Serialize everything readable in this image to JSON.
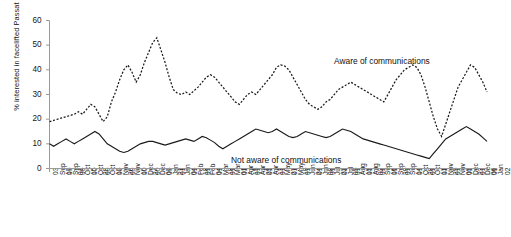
{
  "chart_data": {
    "type": "line",
    "title": "",
    "xlabel": "",
    "ylabel": "% interested in facelifted Passat",
    "ylim": [
      0,
      60
    ],
    "yticks": [
      0,
      10,
      20,
      30,
      40,
      50,
      60
    ],
    "grid": false,
    "legend_position": "inline-annotations",
    "annotations": [
      {
        "text": "Aware of communications",
        "series": "Aware of communications"
      },
      {
        "text": "Not aware of communications",
        "series": "Not aware of communications"
      }
    ],
    "categories": [
      "03 Sep 00",
      "17 Sep 00",
      "01 Oct 00",
      "15 Oct 00",
      "29 Oct 00",
      "12 Nov 00",
      "26 Nov 00",
      "10 Dec 00",
      "24 Dec 00",
      "07 Jan 01",
      "21 Jan 01",
      "04 Feb 01",
      "18 Feb 01",
      "04 Mar 01",
      "18 Mar 01",
      "01 Apr 01",
      "15 Apr 01",
      "29 Apr 01",
      "13 May 01",
      "27 May 01",
      "10 Jun 01",
      "24 Jun 01",
      "08 Jul 01",
      "22 Jul 01",
      "05 Aug 01",
      "19 Aug 01",
      "02 Sep 01",
      "16 Sep 01",
      "30 Sep 01",
      "14 Oct 01",
      "28 Oct 01",
      "11 Nov 01",
      "25 Nov 01",
      "09 Dec 01",
      "23 Dec 01",
      "06 Jan 02"
    ],
    "series": [
      {
        "name": "Aware of communications",
        "style": "dashed",
        "color": "#1a1a1a",
        "values": [
          19,
          19.5,
          20,
          20.5,
          21,
          21.5,
          22,
          23,
          22,
          24,
          26,
          25,
          22,
          19,
          21,
          27,
          31,
          36,
          40,
          42,
          39,
          35,
          38,
          43,
          47,
          51,
          53,
          48,
          43,
          37,
          32,
          30.5,
          30,
          31,
          30,
          31.5
        ],
        "values_extended": [
          33,
          35,
          37,
          38,
          37,
          35,
          33,
          31,
          29,
          27,
          26,
          28,
          30,
          31,
          30,
          32,
          34,
          36,
          38,
          41,
          42,
          41.5,
          40,
          37,
          34,
          31,
          28,
          26,
          25,
          24,
          25,
          27,
          28,
          30,
          32,
          33,
          34,
          35,
          34,
          33,
          32,
          31,
          30,
          29,
          28,
          27,
          30,
          33,
          36,
          38,
          40,
          41,
          42,
          41,
          38,
          33,
          27,
          21,
          16,
          13,
          18,
          23,
          28,
          33,
          36,
          39,
          42,
          41,
          38,
          35,
          31
        ]
      },
      {
        "name": "Not aware of communications",
        "style": "solid",
        "color": "#1a1a1a",
        "values": [
          10,
          9,
          10,
          11,
          12,
          11,
          10,
          11,
          12,
          13,
          14,
          15,
          14,
          12,
          10,
          9,
          8,
          7,
          6.5,
          7,
          8,
          9,
          10,
          10.5,
          11,
          11,
          10.5,
          10,
          9.5,
          10,
          10.5,
          11,
          11.5,
          12,
          11.5,
          11
        ],
        "values_extended": [
          12,
          13,
          12.5,
          11.5,
          10.5,
          9,
          8,
          9,
          10,
          11,
          12,
          13,
          14,
          15,
          16,
          15.5,
          15,
          14.5,
          15,
          16,
          15,
          14,
          13,
          12.5,
          13,
          14,
          15,
          14.5,
          14,
          13.5,
          13,
          12.5,
          13,
          14,
          15,
          16,
          15.5,
          15,
          14,
          13,
          12,
          11.5,
          11,
          10.5,
          10,
          9.5,
          9,
          8.5,
          8,
          7.5,
          7,
          6.5,
          6,
          5.5,
          5,
          4.5,
          4,
          6,
          8,
          10,
          12,
          13,
          14,
          15,
          16,
          17,
          16,
          15,
          14,
          12.5,
          11
        ]
      }
    ]
  },
  "axes": {
    "y_tick_labels": [
      "60",
      "50",
      "40",
      "30",
      "20",
      "10",
      "0"
    ],
    "y_axis_title": "% interested in facelifted Passat"
  },
  "annotations": {
    "aware": "Aware of communications",
    "not_aware": "Not aware of communications"
  }
}
